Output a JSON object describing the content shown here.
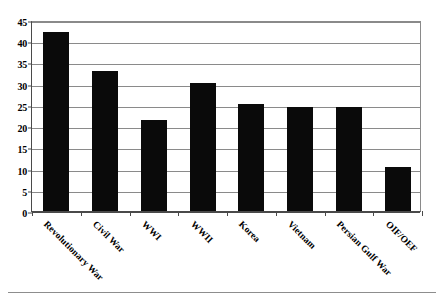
{
  "chart_data": {
    "type": "bar",
    "title": "",
    "subtitle": "",
    "xlabel": "",
    "ylabel": "",
    "categories": [
      "Revolutionary War",
      "Civil War",
      "WWI",
      "WWII",
      "Korea",
      "Vietnam",
      "Persian Gulf War",
      "OIF/OEF"
    ],
    "values": [
      42.2,
      33.1,
      21.4,
      30.2,
      25.3,
      24.5,
      24.5,
      10.4
    ],
    "ylim": [
      0,
      45
    ],
    "ytick_labels": [
      "0",
      "5",
      "10",
      "15",
      "20",
      "25",
      "30",
      "35",
      "40",
      "45"
    ],
    "ytick_values": [
      0,
      5,
      10,
      15,
      20,
      25,
      30,
      35,
      40,
      45
    ],
    "grid": true,
    "legend": false,
    "legend_position": "none",
    "bar_color": "#0a0a0a",
    "grid_color": "#8a8a8a",
    "axis_color": "#4a4a4a",
    "background_color": "#ffffff",
    "xtick_label_rotation": 45
  },
  "figure": {
    "bottom_rule": true
  }
}
